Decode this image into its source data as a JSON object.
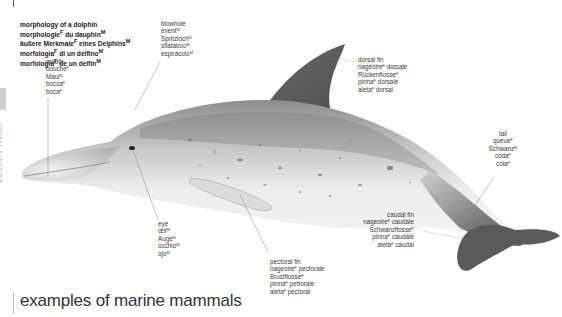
{
  "page": {
    "side_tab": "ANIMAL KINGDOM",
    "bottom_heading": "examples of marine mammals"
  },
  "title_block": {
    "lines": [
      {
        "text": "morphology of a dolphin",
        "gender": ""
      },
      {
        "text": "morphologie",
        "gender": "F",
        "rest": " du dauphin",
        "gender2": "M"
      },
      {
        "text": "äußere Merkmale",
        "gender": "F",
        "rest": " eines Delphins",
        "gender2": "M"
      },
      {
        "text": "morfologia",
        "gender": "F",
        "rest": " di un delfino",
        "gender2": "M"
      },
      {
        "text": "morfología",
        "gender": "F",
        "rest": " de un delfín",
        "gender2": "M"
      }
    ]
  },
  "labels": {
    "mouth": [
      {
        "t": "mouth",
        "g": ""
      },
      {
        "t": "bouche",
        "g": "F"
      },
      {
        "t": "Maul",
        "g": "N"
      },
      {
        "t": "bocca",
        "g": "F"
      },
      {
        "t": "boca",
        "g": "F"
      }
    ],
    "blowhole": [
      {
        "t": "blowhole",
        "g": ""
      },
      {
        "t": "évent",
        "g": "M"
      },
      {
        "t": "Spritzloch",
        "g": "N"
      },
      {
        "t": "sfiatatoio",
        "g": "M"
      },
      {
        "t": "espiráculo",
        "g": "M"
      }
    ],
    "dorsal_fin": [
      {
        "t": "dorsal fin",
        "g": ""
      },
      {
        "t": "nageoire",
        "g": "F",
        "r": " dorsale"
      },
      {
        "t": "Rückenflosse",
        "g": "F"
      },
      {
        "t": "pinna",
        "g": "F",
        "r": " dorsale"
      },
      {
        "t": "aleta",
        "g": "F",
        "r": " dorsal"
      }
    ],
    "tail": [
      {
        "t": "tail",
        "g": ""
      },
      {
        "t": "queue",
        "g": "F"
      },
      {
        "t": "Schwanz",
        "g": "M"
      },
      {
        "t": "coda",
        "g": "F"
      },
      {
        "t": "cola",
        "g": "F"
      }
    ],
    "caudal_fin": [
      {
        "t": "caudal fin",
        "g": ""
      },
      {
        "t": "nageoire",
        "g": "F",
        "r": " caudale"
      },
      {
        "t": "Schwanzflosse",
        "g": "F"
      },
      {
        "t": "pinna",
        "g": "F",
        "r": " caudale"
      },
      {
        "t": "aleta",
        "g": "F",
        "r": " caudal"
      }
    ],
    "eye": [
      {
        "t": "eye",
        "g": ""
      },
      {
        "t": "œil",
        "g": "M"
      },
      {
        "t": "Auge",
        "g": "N"
      },
      {
        "t": "occhio",
        "g": "M"
      },
      {
        "t": "ojo",
        "g": "M"
      }
    ],
    "pectoral_fin": [
      {
        "t": "pectoral fin",
        "g": ""
      },
      {
        "t": "nageoire",
        "g": "F",
        "r": " pectorale"
      },
      {
        "t": "Brustflosse",
        "g": "F"
      },
      {
        "t": "pinna",
        "g": "F",
        "r": " pettorale"
      },
      {
        "t": "aleta",
        "g": "F",
        "r": " pectoral"
      }
    ]
  },
  "colors": {
    "body_light": "#e9e9e9",
    "body_mid": "#b5b5b5",
    "body_dark": "#5e5e5e",
    "fin_dark": "#4a4a4a",
    "leader_line": "#8a8a8a"
  }
}
